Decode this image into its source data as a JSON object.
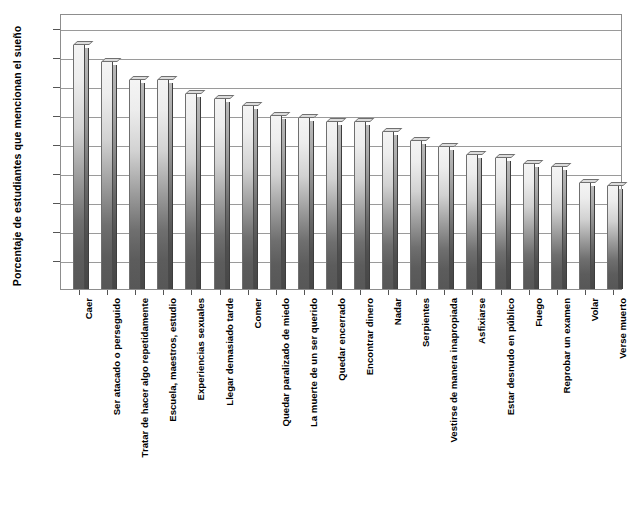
{
  "chart_data": {
    "type": "bar",
    "title": "",
    "subtitle": "",
    "xlabel": "",
    "ylabel": "Porcentaje de estudiantes que mencionan el sueño",
    "ylim": [
      0,
      95
    ],
    "ytick_values": [
      10,
      20,
      30,
      40,
      50,
      60,
      70,
      80,
      90
    ],
    "ytick_labels": [
      "10",
      "20",
      "30",
      "40",
      "50",
      "60",
      "70",
      "80",
      "90"
    ],
    "grid": true,
    "legend": false,
    "orientation": "vertical",
    "categories": [
      "Caer",
      "Ser atacado o perseguido",
      "Tratar de hacer algo repetidamente",
      "Escuela, maestros, estudio",
      "Experiencias sexuales",
      "Llegar demasiado tarde",
      "Comer",
      "Quedar paralizado de miedo",
      "La muerte de un ser querido",
      "Quedar encerrado",
      "Encontrar dinero",
      "Nadar",
      "Serpientes",
      "Vestirse de manera inapropiada",
      "Asfixiarse",
      "Estar desnudo en público",
      "Fuego",
      "Reprobar un examen",
      "Volar",
      "Verse muerto"
    ],
    "values": [
      84,
      78,
      72,
      72,
      67,
      65.5,
      63,
      59.5,
      59,
      57.5,
      57.5,
      54,
      51,
      49,
      46,
      45,
      43,
      42,
      36.5,
      35.5
    ]
  },
  "style": {
    "bar_fill_top": "#f4f4f4",
    "bar_fill_bottom": "#575757",
    "bar_side": "#4f4f4f",
    "grid_color": "#9a9a9a",
    "frame_color": "#8d8d8d",
    "text_color": "#000000",
    "background": "#ffffff"
  },
  "artifacts": {
    "bleed_text": ""
  }
}
